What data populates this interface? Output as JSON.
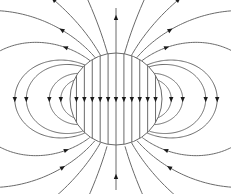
{
  "diagram": {
    "colors": {
      "line": "#6a6a6a",
      "arrow": "#1a1a1a",
      "background": "#ffffff"
    },
    "interior_field_direction": "down",
    "exterior_top_direction": "up",
    "exterior_bottom_direction": "up",
    "side_loop_direction": "down",
    "interior_line_count": 11,
    "side_loops_per_side": 4,
    "open_lines_per_quadrant": 4
  }
}
